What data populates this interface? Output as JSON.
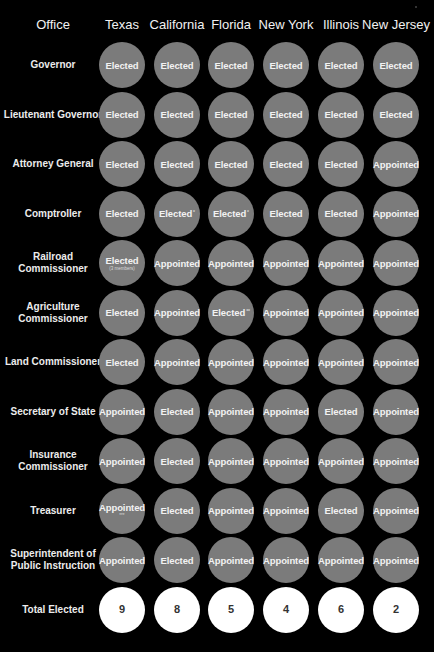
{
  "columns": {
    "office_header": "Office",
    "states": [
      "Texas",
      "California",
      "Florida",
      "New York",
      "Illinois",
      "New Jersey"
    ]
  },
  "rows": [
    {
      "office": "Governor",
      "values": [
        "Elected",
        "Elected",
        "Elected",
        "Elected",
        "Elected",
        "Elected"
      ]
    },
    {
      "office": "Lieutenant Governor",
      "values": [
        "Elected",
        "Elected",
        "Elected",
        "Elected",
        "Elected",
        "Elected"
      ]
    },
    {
      "office": "Attorney General",
      "values": [
        "Elected",
        "Elected",
        "Elected",
        "Elected",
        "Elected",
        "Appointed"
      ]
    },
    {
      "office": "Comptroller",
      "values": [
        "Elected",
        "Elected",
        "Elected",
        "Elected",
        "Elected",
        "Appointed"
      ],
      "marks": [
        "",
        "*",
        "*",
        "",
        "",
        ""
      ]
    },
    {
      "office": "Railroad Commissioner",
      "values": [
        "Elected",
        "Appointed",
        "Appointed",
        "Appointed",
        "Appointed",
        "Appointed"
      ],
      "notes": [
        "(3 members)",
        "",
        "",
        "",
        "",
        ""
      ]
    },
    {
      "office": "Agriculture Commissioner",
      "values": [
        "Elected",
        "Appointed",
        "Elected",
        "Appointed",
        "Appointed",
        "Appointed"
      ],
      "marks": [
        "",
        "",
        "**",
        "",
        "",
        ""
      ]
    },
    {
      "office": "Land Commissioner",
      "values": [
        "Elected",
        "Appointed",
        "Appointed",
        "Appointed",
        "Appointed",
        "Appointed"
      ]
    },
    {
      "office": "Secretary of State",
      "values": [
        "Appointed",
        "Elected",
        "Appointed",
        "Appointed",
        "Elected",
        "Appointed"
      ]
    },
    {
      "office": "Insurance Commissioner",
      "values": [
        "Appointed",
        "Elected",
        "Appointed",
        "Appointed",
        "Appointed",
        "Appointed"
      ]
    },
    {
      "office": "Treasurer",
      "values": [
        "Appointed",
        "Elected",
        "Appointed",
        "Appointed",
        "Elected",
        "Appointed"
      ],
      "notes": [
        "***",
        "",
        "",
        "",
        "",
        ""
      ]
    },
    {
      "office": "Superintendent of Public Instruction",
      "values": [
        "Appointed",
        "Elected",
        "Appointed",
        "Appointed",
        "Appointed",
        "Appointed"
      ]
    }
  ],
  "totals": {
    "label": "Total Elected",
    "values": [
      "9",
      "8",
      "5",
      "4",
      "6",
      "2"
    ]
  },
  "colors": {
    "background": "#000000",
    "cell": "#7b7b7b",
    "total_cell": "#ffffff",
    "text": "#f2f2f2"
  },
  "chart_data": {
    "type": "table",
    "title": "",
    "columns": [
      "Office",
      "Texas",
      "California",
      "Florida",
      "New York",
      "Illinois",
      "New Jersey"
    ],
    "rows": [
      [
        "Governor",
        "Elected",
        "Elected",
        "Elected",
        "Elected",
        "Elected",
        "Elected"
      ],
      [
        "Lieutenant Governor",
        "Elected",
        "Elected",
        "Elected",
        "Elected",
        "Elected",
        "Elected"
      ],
      [
        "Attorney General",
        "Elected",
        "Elected",
        "Elected",
        "Elected",
        "Elected",
        "Appointed"
      ],
      [
        "Comptroller",
        "Elected",
        "Elected*",
        "Elected*",
        "Elected",
        "Elected",
        "Appointed"
      ],
      [
        "Railroad Commissioner",
        "Elected (3 members)",
        "Appointed",
        "Appointed",
        "Appointed",
        "Appointed",
        "Appointed"
      ],
      [
        "Agriculture Commissioner",
        "Elected",
        "Appointed",
        "Elected**",
        "Appointed",
        "Appointed",
        "Appointed"
      ],
      [
        "Land Commissioner",
        "Elected",
        "Appointed",
        "Appointed",
        "Appointed",
        "Appointed",
        "Appointed"
      ],
      [
        "Secretary of State",
        "Appointed",
        "Elected",
        "Appointed",
        "Appointed",
        "Elected",
        "Appointed"
      ],
      [
        "Insurance Commissioner",
        "Appointed",
        "Elected",
        "Appointed",
        "Appointed",
        "Appointed",
        "Appointed"
      ],
      [
        "Treasurer",
        "Appointed***",
        "Elected",
        "Appointed",
        "Appointed",
        "Elected",
        "Appointed"
      ],
      [
        "Superintendent of Public Instruction",
        "Appointed",
        "Elected",
        "Appointed",
        "Appointed",
        "Appointed",
        "Appointed"
      ],
      [
        "Total Elected",
        "9",
        "8",
        "5",
        "4",
        "6",
        "2"
      ]
    ],
    "series": [
      {
        "name": "Total Elected",
        "categories": [
          "Texas",
          "California",
          "Florida",
          "New York",
          "Illinois",
          "New Jersey"
        ],
        "values": [
          9,
          8,
          5,
          4,
          6,
          2
        ]
      }
    ]
  }
}
